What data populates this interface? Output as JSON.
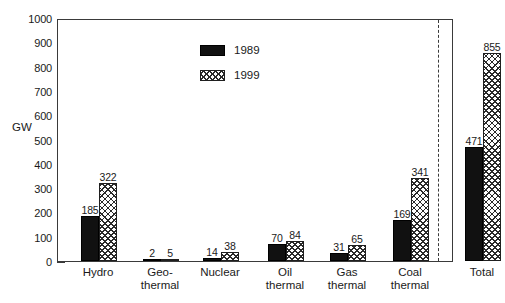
{
  "chart_data": {
    "type": "bar",
    "title": "",
    "xlabel": "",
    "ylabel": "GW",
    "ylim": [
      0,
      1000
    ],
    "yticks": [
      0,
      100,
      200,
      300,
      400,
      500,
      600,
      700,
      800,
      900,
      1000
    ],
    "ytick_labels": [
      "0",
      "100",
      "200",
      "300",
      "400",
      "500",
      "600",
      "700",
      "800",
      "900",
      "1000"
    ],
    "grid": false,
    "legend_position": "inside-top-center",
    "categories": [
      "Hydro",
      "Geo-\nthermal",
      "Nuclear",
      "Oil\nthermal",
      "Gas\nthermal",
      "Coal\nthermal",
      "Total"
    ],
    "series": [
      {
        "name": "1989",
        "fill": "solid-black",
        "color": "#111111",
        "values": [
          185,
          2,
          14,
          70,
          31,
          169,
          471
        ]
      },
      {
        "name": "1999",
        "fill": "crosshatch",
        "color": "#ffffff",
        "values": [
          322,
          5,
          38,
          84,
          65,
          341,
          855
        ]
      }
    ],
    "data_labels": [
      [
        "185",
        "322"
      ],
      [
        "2",
        "5"
      ],
      [
        "14",
        "38"
      ],
      [
        "70",
        "84"
      ],
      [
        "31",
        "65"
      ],
      [
        "169",
        "341"
      ],
      [
        "471",
        "855"
      ]
    ],
    "annotations": [
      {
        "type": "vertical-dashed-line",
        "before_category": "Total"
      }
    ]
  },
  "legend": {
    "entries": [
      {
        "label": "1989",
        "fill": "solid"
      },
      {
        "label": "1999",
        "fill": "hatch"
      }
    ]
  },
  "colors": {
    "series_1989": "#111111",
    "series_1999": "#ffffff",
    "axis": "#3a3a3a",
    "text": "#1a1a1a",
    "background": "#ffffff"
  }
}
